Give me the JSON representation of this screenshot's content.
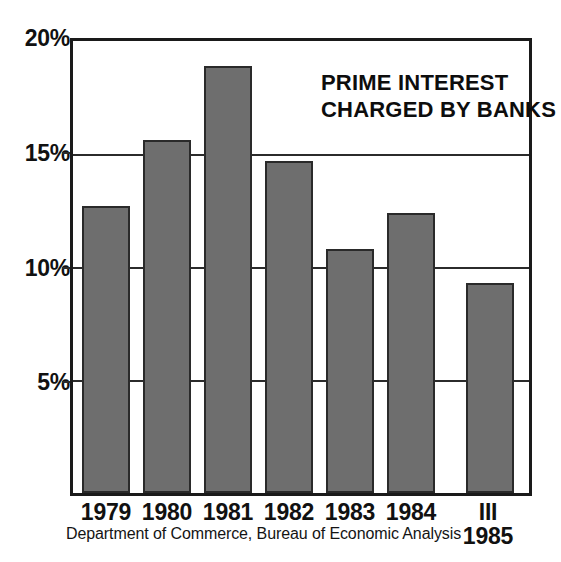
{
  "chart_data": {
    "type": "bar",
    "title": "PRIME INTEREST CHARGED BY BANKS",
    "title_lines": [
      "PRIME INTEREST",
      "CHARGED BY BANKS"
    ],
    "xlabel": "",
    "ylabel": "",
    "categories": [
      "1979",
      "1980",
      "1981",
      "1982",
      "1983",
      "1984",
      "III 1985"
    ],
    "values": [
      12.7,
      15.6,
      18.9,
      14.7,
      10.8,
      12.4,
      9.3
    ],
    "ylim": [
      0,
      20
    ],
    "grid": true,
    "legend": "none",
    "bar_color": "#6e6e6e",
    "bar_edge_color": "#2a2a2a",
    "frame_color": "#1a1a1a",
    "background": "#ffffff",
    "y_ticks": [
      {
        "value": 20,
        "label": "20%"
      },
      {
        "value": 15,
        "label": "15%"
      },
      {
        "value": 10,
        "label": "10%"
      },
      {
        "value": 5,
        "label": "5%"
      }
    ],
    "x_ticks": [
      {
        "label": "1979",
        "sub": ""
      },
      {
        "label": "1980",
        "sub": ""
      },
      {
        "label": "1981",
        "sub": ""
      },
      {
        "label": "1982",
        "sub": ""
      },
      {
        "label": "1983",
        "sub": ""
      },
      {
        "label": "1984",
        "sub": ""
      },
      {
        "label": "III",
        "sub": "1985"
      }
    ],
    "source": "Department of Commerce, Bureau of Economic Analysis"
  }
}
